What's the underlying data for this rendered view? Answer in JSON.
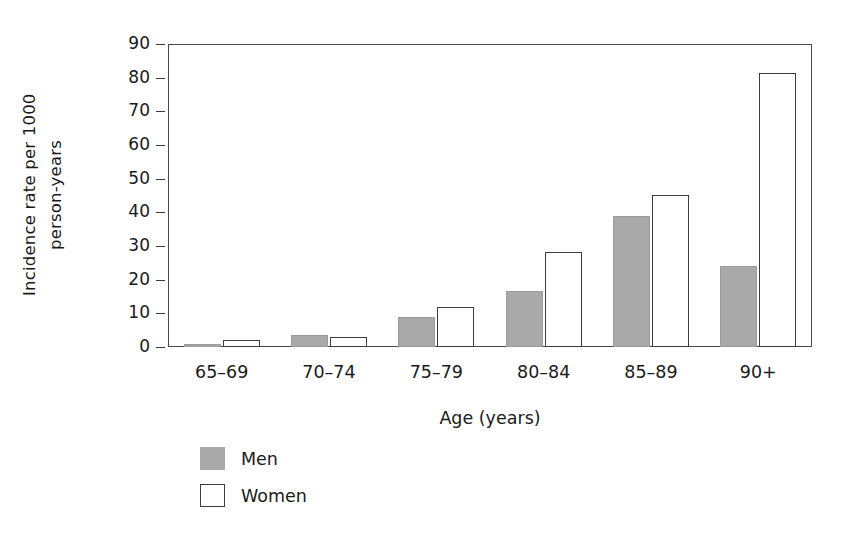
{
  "chart_data": {
    "type": "bar",
    "title": "",
    "subtitle": "",
    "xlabel": "Age (years)",
    "ylabel": "Incidence rate per 1000 person-years",
    "ylabel_lines": [
      "Incidence rate per 1000",
      "person-years"
    ],
    "categories": [
      "65–69",
      "70–74",
      "75–79",
      "80–84",
      "85–89",
      "90+"
    ],
    "series": [
      {
        "name": "Men",
        "color": "#a9a9a9",
        "values": [
          1.0,
          3.5,
          8.8,
          16.5,
          39.0,
          24.2
        ]
      },
      {
        "name": "Women",
        "color": "#ffffff",
        "values": [
          2.0,
          3.0,
          12.0,
          28.3,
          45.2,
          81.5
        ]
      }
    ],
    "ylim": [
      0,
      90
    ],
    "yticks": [
      0,
      10,
      20,
      30,
      40,
      50,
      60,
      70,
      80,
      90
    ],
    "ytick_labels": [
      "0",
      "10",
      "20",
      "30",
      "40",
      "50",
      "60",
      "70",
      "80",
      "90"
    ],
    "grid": false,
    "legend_position": "below-left",
    "legend": [
      {
        "label": "Men",
        "swatch": "filled-gray"
      },
      {
        "label": "Women",
        "swatch": "outlined-white"
      }
    ],
    "colors": {
      "men_fill": "#a9a9a9",
      "women_fill": "#ffffff",
      "outline": "#3d3d3d",
      "axis": "#4a4a4a",
      "text": "#1a1a1a",
      "background": "#ffffff"
    }
  }
}
